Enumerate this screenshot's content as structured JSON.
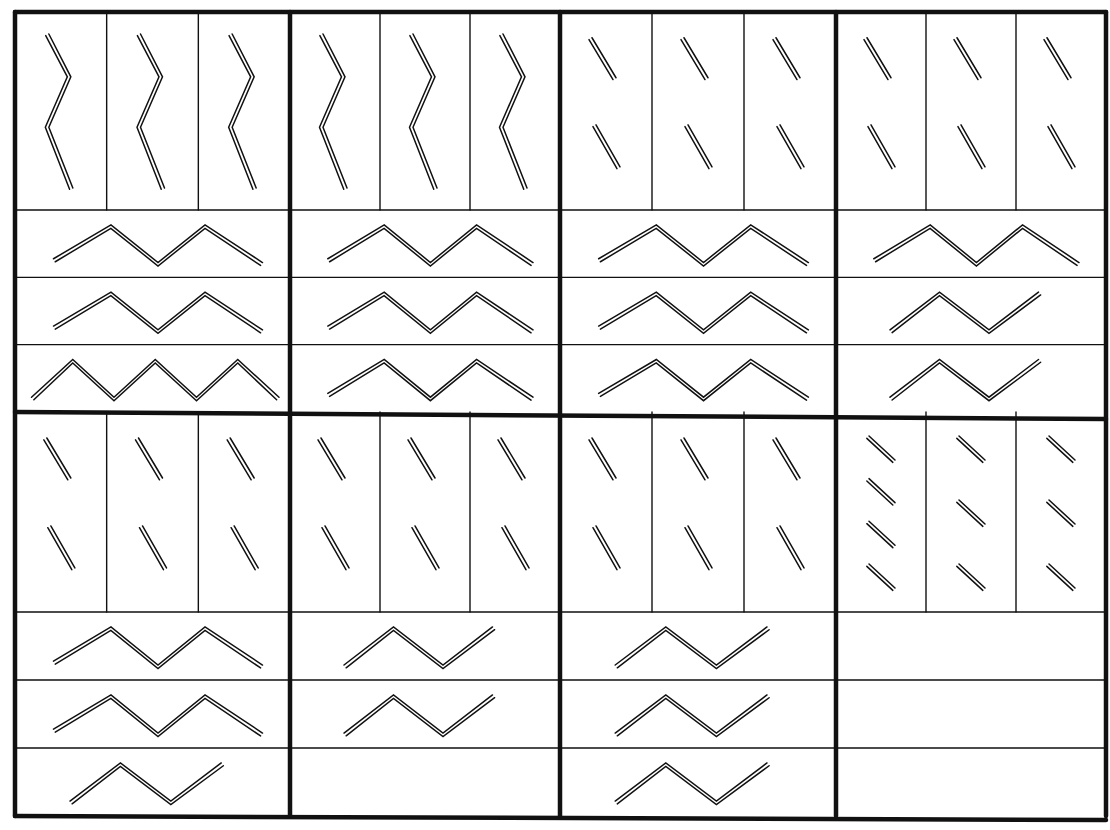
{
  "diagram": {
    "title": "Double-line zigzag pattern matrix",
    "stroke_color": "#111111",
    "background_color": "#ffffff",
    "grid": {
      "columns": 4,
      "rows": 2,
      "outer_left": 15,
      "outer_right": 1106,
      "outer_top": 12,
      "outer_bottom": 816,
      "middle_horizontal": 412,
      "column_dividers": [
        15,
        290,
        560,
        836,
        1106
      ]
    },
    "panels": [
      {
        "id": "panel-r1c1",
        "row": 1,
        "col": 1,
        "top_cells": [
          {
            "glyph": "vertical-zigzag-3-segment"
          },
          {
            "glyph": "vertical-zigzag-3-segment"
          },
          {
            "glyph": "vertical-zigzag-3-segment"
          }
        ],
        "strips": [
          {
            "glyph": "horizontal-zigzag-4-segment"
          },
          {
            "glyph": "horizontal-zigzag-4-segment"
          },
          {
            "glyph": "horizontal-zigzag-6-segment"
          }
        ]
      },
      {
        "id": "panel-r1c2",
        "row": 1,
        "col": 2,
        "top_cells": [
          {
            "glyph": "vertical-zigzag-3-segment"
          },
          {
            "glyph": "vertical-zigzag-3-segment"
          },
          {
            "glyph": "vertical-zigzag-3-segment"
          }
        ],
        "strips": [
          {
            "glyph": "horizontal-zigzag-4-segment"
          },
          {
            "glyph": "horizontal-zigzag-4-segment"
          },
          {
            "glyph": "horizontal-zigzag-4-segment"
          }
        ]
      },
      {
        "id": "panel-r1c3",
        "row": 1,
        "col": 3,
        "top_cells": [
          {
            "glyph": "two-diagonal-double-strokes"
          },
          {
            "glyph": "two-diagonal-double-strokes"
          },
          {
            "glyph": "two-diagonal-double-strokes"
          }
        ],
        "strips": [
          {
            "glyph": "horizontal-zigzag-4-segment"
          },
          {
            "glyph": "horizontal-zigzag-4-segment"
          },
          {
            "glyph": "horizontal-zigzag-4-segment"
          }
        ]
      },
      {
        "id": "panel-r1c4",
        "row": 1,
        "col": 4,
        "top_cells": [
          {
            "glyph": "two-diagonal-double-strokes"
          },
          {
            "glyph": "two-diagonal-double-strokes"
          },
          {
            "glyph": "two-diagonal-double-strokes"
          }
        ],
        "strips": [
          {
            "glyph": "horizontal-zigzag-4-segment"
          },
          {
            "glyph": "horizontal-zigzag-3-segment"
          },
          {
            "glyph": "horizontal-zigzag-3-segment"
          }
        ]
      },
      {
        "id": "panel-r2c1",
        "row": 2,
        "col": 1,
        "top_cells": [
          {
            "glyph": "two-diagonal-double-strokes"
          },
          {
            "glyph": "two-diagonal-double-strokes"
          },
          {
            "glyph": "two-diagonal-double-strokes"
          }
        ],
        "strips": [
          {
            "glyph": "horizontal-zigzag-4-segment"
          },
          {
            "glyph": "horizontal-zigzag-4-segment"
          },
          {
            "glyph": "horizontal-zigzag-3-segment"
          }
        ]
      },
      {
        "id": "panel-r2c2",
        "row": 2,
        "col": 2,
        "top_cells": [
          {
            "glyph": "two-diagonal-double-strokes"
          },
          {
            "glyph": "two-diagonal-double-strokes"
          },
          {
            "glyph": "two-diagonal-double-strokes"
          }
        ],
        "strips": [
          {
            "glyph": "horizontal-zigzag-3-segment"
          },
          {
            "glyph": "horizontal-zigzag-3-segment"
          },
          {
            "glyph": "empty"
          }
        ]
      },
      {
        "id": "panel-r2c3",
        "row": 2,
        "col": 3,
        "top_cells": [
          {
            "glyph": "two-diagonal-double-strokes"
          },
          {
            "glyph": "two-diagonal-double-strokes"
          },
          {
            "glyph": "two-diagonal-double-strokes"
          }
        ],
        "strips": [
          {
            "glyph": "horizontal-zigzag-3-segment"
          },
          {
            "glyph": "horizontal-zigzag-3-segment"
          },
          {
            "glyph": "horizontal-zigzag-3-segment"
          }
        ]
      },
      {
        "id": "panel-r2c4",
        "row": 2,
        "col": 4,
        "top_cells": [
          {
            "glyph": "four-short-diagonal-double-strokes"
          },
          {
            "glyph": "three-short-diagonal-double-strokes"
          },
          {
            "glyph": "three-short-diagonal-double-strokes"
          }
        ],
        "strips": [
          {
            "glyph": "empty"
          },
          {
            "glyph": "empty"
          },
          {
            "glyph": "empty"
          }
        ]
      }
    ]
  }
}
